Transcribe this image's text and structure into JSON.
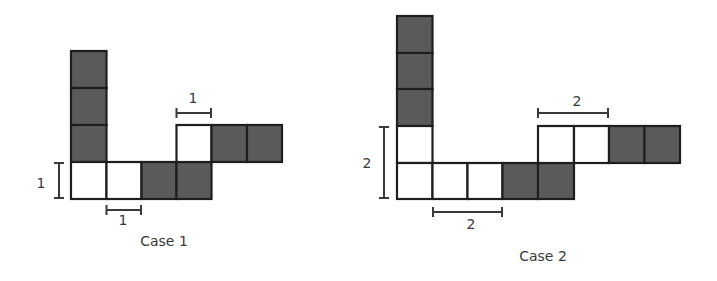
{
  "colors": {
    "filled": "#5a5a5a",
    "empty": "#ffffff",
    "stroke": "#1e1e1e",
    "bracket": "#3a3a3a"
  },
  "cases": [
    {
      "caption": "Case 1",
      "dimension": "1",
      "labels": {
        "vertical": "1",
        "bottom": "1",
        "top": "1"
      }
    },
    {
      "caption": "Case 2",
      "dimension": "2",
      "labels": {
        "vertical": "2",
        "bottom": "2",
        "top": "2"
      }
    }
  ]
}
